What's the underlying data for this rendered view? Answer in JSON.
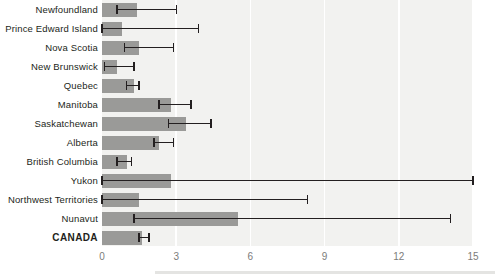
{
  "chart_data": {
    "type": "bar",
    "orientation": "horizontal",
    "title": "",
    "subtitle": "",
    "xlabel": "",
    "ylabel": "",
    "xlim": [
      0,
      15
    ],
    "ylim": null,
    "grid": true,
    "gridlines_x": [
      3,
      6,
      9,
      12,
      15
    ],
    "legend": null,
    "legend_position": "none",
    "xticks": [
      0,
      3,
      6,
      9,
      12,
      15
    ],
    "xtick_labels": [
      "0",
      "3",
      "6",
      "9",
      "12",
      "15"
    ],
    "categories": [
      "Newfoundland",
      "Prince Edward Island",
      "Nova Scotia",
      "New Brunswick",
      "Quebec",
      "Manitoba",
      "Saskatchewan",
      "Alberta",
      "British Columbia",
      "Yukon",
      "Northwest Territories",
      "Nunavut",
      "CANADA"
    ],
    "values": [
      1.4,
      0.8,
      1.5,
      0.6,
      1.3,
      2.8,
      3.4,
      2.3,
      1.0,
      2.8,
      1.5,
      5.5,
      1.6
    ],
    "error_low": [
      0.6,
      0.0,
      0.9,
      0.1,
      1.0,
      2.3,
      2.7,
      2.1,
      0.6,
      0.0,
      0.0,
      1.3,
      1.5
    ],
    "error_high": [
      3.0,
      3.9,
      2.9,
      1.3,
      1.5,
      3.6,
      4.4,
      2.9,
      1.2,
      15.0,
      8.3,
      14.1,
      1.9
    ],
    "bar_color": "#9a9a98",
    "error_color": "#231f20",
    "plot_background": "#f2f2f0",
    "gridline_color": "#ffffff",
    "tick_label_color": "#7c7c7a",
    "category_label_color": "#231f20",
    "emphasized_category": "CANADA"
  }
}
